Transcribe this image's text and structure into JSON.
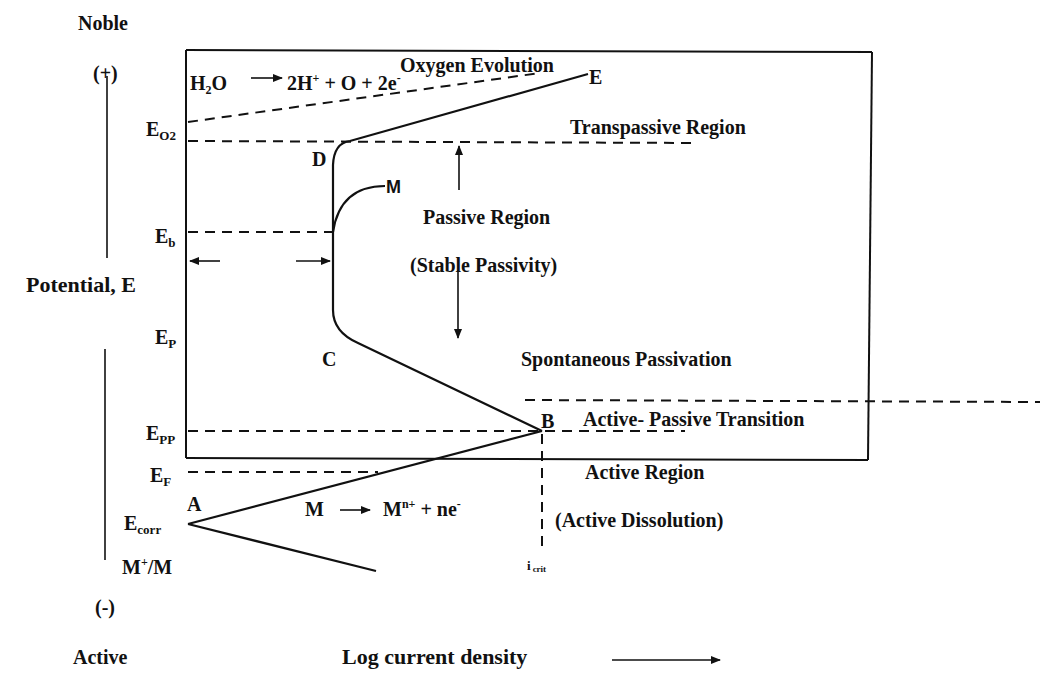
{
  "axes": {
    "y_top_label": "Noble",
    "y_top_sign": "(+)",
    "y_label": "Potential, E",
    "y_bottom_sign": "(-)",
    "y_bottom_label": "Active",
    "x_label": "Log current density"
  },
  "potential_levels": [
    {
      "id": "eo2",
      "main": "E",
      "sub": "O2"
    },
    {
      "id": "eb",
      "main": "E",
      "sub": "b"
    },
    {
      "id": "ep",
      "main": "E",
      "sub": "P"
    },
    {
      "id": "epp",
      "main": "E",
      "sub": "PP"
    },
    {
      "id": "ef",
      "main": "E",
      "sub": "F"
    },
    {
      "id": "ecorr",
      "main": "E",
      "sub": "corr"
    },
    {
      "id": "mm",
      "main": "M",
      "sup": "+",
      "rest": "/M"
    }
  ],
  "points": {
    "A": "A",
    "B": "B",
    "C": "C",
    "D": "D",
    "E": "E",
    "M": "M"
  },
  "reactions": {
    "water": {
      "lhs": "H",
      "lhs_sub": "2",
      "lhs_end": "O",
      "rhs": "2H",
      "rhs_sup": "+",
      "rhs_end": " + O + 2e",
      "rhs_end_sup": "-"
    },
    "metal": {
      "lhs": "M",
      "rhs": "M",
      "rhs_sup": "n+",
      "rhs_end": " + ne",
      "rhs_end_sup": "-"
    }
  },
  "regions": {
    "oxygen_evolution": "Oxygen Evolution",
    "transpassive": "Transpassive Region",
    "passive": "Passive Region",
    "stable_passivity": "(Stable Passivity)",
    "spontaneous_passivation": "Spontaneous Passivation",
    "active_passive_transition": "Active- Passive Transition",
    "active": "Active Region",
    "active_dissolution": "(Active Dissolution)"
  },
  "icrit": {
    "main": "i",
    "sub": "crit"
  },
  "colors": {
    "ink": "#111111",
    "background": "#ffffff"
  }
}
